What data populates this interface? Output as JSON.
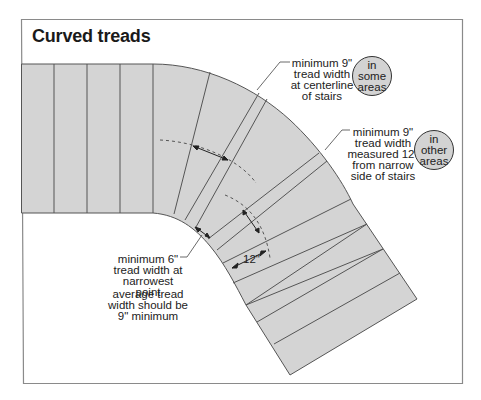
{
  "title": "Curved treads",
  "annotations": {
    "centerline": {
      "lines": [
        "minimum 9\"",
        "tread width",
        "at centerline",
        "of stairs"
      ],
      "badge": [
        "in some",
        "areas"
      ]
    },
    "measured": {
      "lines": [
        "minimum 9\"",
        "tread width",
        "measured 12\"",
        "from narrow",
        "side of stairs"
      ],
      "badge": [
        "in other",
        "areas"
      ]
    },
    "narrowest": {
      "lines": [
        "minimum 6\"",
        "tread width at",
        "narrowest point"
      ]
    },
    "average": {
      "lines": [
        "average tread",
        "width should be",
        "9\" minimum"
      ]
    },
    "dimension_label": "12\""
  },
  "colors": {
    "tread_fill": "#d4d4d4",
    "line": "#555555",
    "badge_fill": "#d3d3d3",
    "frame": "#888888"
  }
}
